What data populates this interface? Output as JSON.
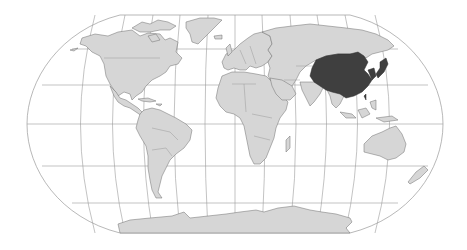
{
  "map": {
    "projection": "Robinson",
    "colors": {
      "background": "#ffffff",
      "land": "#d6d6d6",
      "highlight": "#3f3f3f",
      "graticule": "#9a9a9a",
      "country_border": "#6e6e6e"
    },
    "highlighted_region": {
      "name": "East Asia",
      "countries": [
        "China",
        "Mongolia",
        "North Korea",
        "South Korea",
        "Japan",
        "Taiwan"
      ]
    },
    "continents": [
      "North America",
      "South America",
      "Europe",
      "Africa",
      "Asia",
      "Oceania",
      "Antarctica"
    ]
  }
}
